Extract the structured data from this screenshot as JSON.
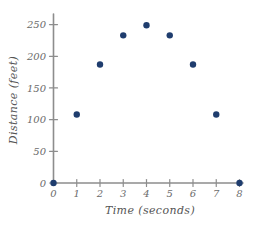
{
  "chart_data": {
    "type": "scatter",
    "title": "",
    "xlabel": "Time (seconds)",
    "ylabel": "Distance (feet)",
    "x": [
      0,
      1,
      2,
      3,
      4,
      5,
      6,
      7,
      8
    ],
    "values": [
      0,
      108,
      187,
      233,
      249,
      233,
      187,
      108,
      0
    ],
    "series": [
      {
        "name": "Distance",
        "points": [
          {
            "x": 0,
            "y": 0
          },
          {
            "x": 1,
            "y": 108
          },
          {
            "x": 2,
            "y": 187
          },
          {
            "x": 3,
            "y": 233
          },
          {
            "x": 4,
            "y": 249
          },
          {
            "x": 5,
            "y": 233
          },
          {
            "x": 6,
            "y": 187
          },
          {
            "x": 7,
            "y": 108
          },
          {
            "x": 8,
            "y": 0
          }
        ]
      }
    ],
    "xlim": [
      0,
      8
    ],
    "ylim": [
      0,
      262
    ],
    "x_ticks": [
      0,
      1,
      2,
      3,
      4,
      5,
      6,
      7,
      8
    ],
    "x_tick_labels": [
      "0",
      "1",
      "2",
      "3",
      "4",
      "5",
      "6",
      "7",
      "8"
    ],
    "y_ticks": [
      0,
      50,
      100,
      150,
      200,
      250
    ],
    "y_tick_labels": [
      "0",
      "50",
      "100",
      "150",
      "200",
      "250"
    ],
    "grid": false,
    "legend": false,
    "legend_position": "none",
    "marker_color": "#1f3d6e",
    "axis_color": "#8d8d8d",
    "tick_label_color": "#6b6b6b",
    "axis_title_color": "#555555",
    "background_color": "#ffffff",
    "marker_radius_px": 3.2
  }
}
